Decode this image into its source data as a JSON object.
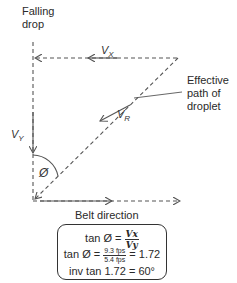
{
  "labels": {
    "falling_drop": [
      "Falling",
      "drop"
    ],
    "effective_path": [
      "Effective",
      "path of",
      "droplet"
    ],
    "belt_direction": "Belt direction"
  },
  "vectors": {
    "vx": {
      "main": "V",
      "sub": "X"
    },
    "vy": {
      "main": "V",
      "sub": "Y"
    },
    "vr": {
      "main": "V",
      "sub": "R"
    },
    "angle": "Ø"
  },
  "formulas": {
    "line1": {
      "lhs": "tan Ø =",
      "num": "Vx",
      "den": "Vy"
    },
    "line2": {
      "lhs": "tan Ø =",
      "num": "9.3 fps",
      "den": "5.4 fps",
      "rhs": "= 1.72"
    },
    "line3": "inv tan 1.72 = 60°"
  },
  "colors": {
    "stroke": "#555555",
    "text": "#2a2a2a"
  }
}
